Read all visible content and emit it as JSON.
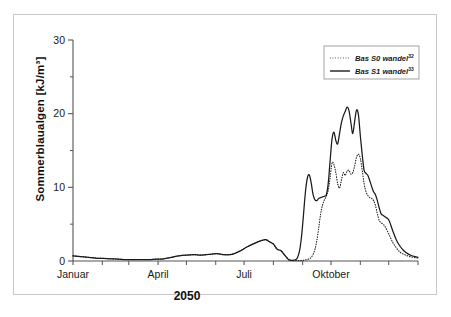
{
  "figure": {
    "title": "",
    "y_axis_label": "Sommerblaualgen [kJ/m³]",
    "x_axis_label": "2050"
  },
  "legend": {
    "position": "top-right",
    "entries": [
      {
        "label": "Bas S0 wandel",
        "superscript": "32",
        "style": "dotted",
        "color": "#1a1a1a"
      },
      {
        "label": "Bas S1 wandel",
        "superscript": "33",
        "style": "solid",
        "color": "#1a1a1a"
      }
    ]
  },
  "chart_data": {
    "type": "line",
    "title": "",
    "xlabel": "2050",
    "ylabel": "Sommerblaualgen [kJ/m³]",
    "ylim": [
      0,
      30
    ],
    "yticks": [
      0,
      10,
      20,
      30
    ],
    "yticks_minor": [
      5,
      15,
      25
    ],
    "xlim": [
      0,
      365
    ],
    "xticks_labeled": [
      {
        "day": 0,
        "label": "Januar"
      },
      {
        "day": 90,
        "label": "April"
      },
      {
        "day": 181,
        "label": "Juli"
      },
      {
        "day": 273,
        "label": "Oktober"
      }
    ],
    "xticks_minor_days": [
      31,
      59,
      120,
      151,
      212,
      243,
      304,
      334,
      365
    ],
    "grid": false,
    "legend_position": "upper right",
    "series": [
      {
        "name": "Bas S0 wandel",
        "style": "dotted",
        "color": "#1a1a1a",
        "x": [
          0,
          8,
          16,
          24,
          32,
          40,
          48,
          56,
          64,
          72,
          80,
          88,
          96,
          104,
          112,
          120,
          128,
          136,
          144,
          152,
          160,
          168,
          176,
          184,
          192,
          200,
          204,
          208,
          212,
          216,
          220,
          224,
          228,
          230,
          232,
          234,
          236,
          238,
          240,
          242,
          244,
          246,
          248,
          250,
          252,
          254,
          256,
          258,
          260,
          262,
          264,
          266,
          268,
          270,
          272,
          274,
          276,
          278,
          280,
          282,
          284,
          286,
          288,
          290,
          292,
          294,
          296,
          298,
          300,
          302,
          304,
          306,
          308,
          310,
          312,
          314,
          316,
          318,
          320,
          322,
          324,
          326,
          328,
          330,
          334,
          338,
          342,
          346,
          350,
          354,
          358,
          362,
          365
        ],
        "y": [
          0.7,
          0.6,
          0.5,
          0.4,
          0.35,
          0.3,
          0.25,
          0.2,
          0.2,
          0.2,
          0.2,
          0.25,
          0.3,
          0.5,
          0.7,
          0.8,
          0.85,
          0.8,
          0.9,
          1.0,
          0.85,
          0.9,
          1.3,
          1.9,
          2.4,
          2.8,
          2.9,
          2.6,
          2.3,
          1.6,
          1.4,
          0.8,
          0.2,
          0.1,
          0.05,
          0.05,
          0.05,
          0.05,
          0.05,
          0.05,
          0.1,
          0.15,
          0.2,
          0.3,
          0.5,
          0.9,
          1.6,
          2.8,
          4.5,
          6.4,
          7.6,
          8.3,
          8.8,
          9.6,
          11.3,
          13.3,
          13.1,
          12.0,
          10.5,
          9.9,
          11.0,
          12.0,
          11.6,
          12.2,
          12.3,
          11.8,
          12.0,
          12.9,
          14.1,
          14.5,
          13.9,
          12.3,
          10.5,
          9.4,
          8.9,
          8.6,
          8.5,
          8.2,
          7.5,
          6.4,
          5.5,
          5.2,
          5.0,
          4.7,
          3.7,
          2.6,
          1.8,
          1.2,
          0.9,
          0.7,
          0.55,
          0.45,
          0.4
        ]
      },
      {
        "name": "Bas S1 wandel",
        "style": "solid",
        "color": "#1a1a1a",
        "x": [
          0,
          8,
          16,
          24,
          32,
          40,
          48,
          56,
          64,
          72,
          80,
          88,
          96,
          104,
          112,
          120,
          128,
          136,
          144,
          152,
          160,
          168,
          176,
          184,
          192,
          200,
          204,
          208,
          212,
          216,
          220,
          224,
          228,
          232,
          236,
          238,
          240,
          242,
          244,
          246,
          248,
          250,
          252,
          254,
          256,
          258,
          260,
          262,
          264,
          266,
          268,
          270,
          272,
          274,
          276,
          278,
          280,
          282,
          284,
          286,
          288,
          290,
          292,
          294,
          296,
          298,
          300,
          302,
          304,
          306,
          308,
          310,
          312,
          314,
          316,
          318,
          320,
          322,
          324,
          326,
          328,
          330,
          334,
          338,
          342,
          346,
          350,
          354,
          358,
          362,
          365
        ],
        "y": [
          0.7,
          0.6,
          0.5,
          0.4,
          0.35,
          0.3,
          0.25,
          0.2,
          0.2,
          0.2,
          0.2,
          0.25,
          0.3,
          0.5,
          0.7,
          0.8,
          0.85,
          0.8,
          0.9,
          1.0,
          0.85,
          0.9,
          1.3,
          1.9,
          2.4,
          2.8,
          2.9,
          2.6,
          2.3,
          1.6,
          1.4,
          0.8,
          0.2,
          0.1,
          0.2,
          0.6,
          1.6,
          3.6,
          6.5,
          9.5,
          11.3,
          11.7,
          10.6,
          9.0,
          8.3,
          8.2,
          8.5,
          8.6,
          8.7,
          8.8,
          9.0,
          10.5,
          13.6,
          16.5,
          17.5,
          16.4,
          15.9,
          17.3,
          18.8,
          19.7,
          20.3,
          20.9,
          20.4,
          18.8,
          17.3,
          19.0,
          20.5,
          19.8,
          17.0,
          14.4,
          12.3,
          11.9,
          11.6,
          10.9,
          10.1,
          9.4,
          9.0,
          8.2,
          7.2,
          6.4,
          6.2,
          6.0,
          5.6,
          4.2,
          2.9,
          2.0,
          1.4,
          1.0,
          0.75,
          0.6,
          0.5
        ]
      }
    ]
  }
}
